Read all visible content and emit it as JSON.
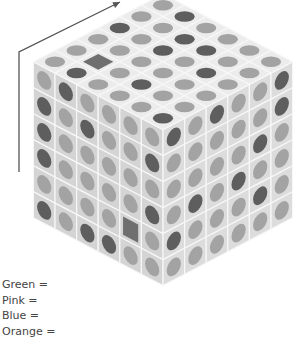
{
  "figure": {
    "type": "isometric-cube",
    "size": 6,
    "colors": {
      "face_top": "#ececec",
      "face_left": "#d4d4d4",
      "face_right": "#dcdcdc",
      "grid_line": "#f7f7f7",
      "dot_light": "#a3a3a3",
      "dot_dark": "#5e5e5e",
      "square": "#6f6f6f",
      "arrow": "#555555"
    },
    "legend_note": "cells: L = light dot, D = dark dot, S = dark square",
    "top_face": [
      [
        "L",
        "D",
        "L",
        "L",
        "L",
        "L"
      ],
      [
        "L",
        "L",
        "D",
        "D",
        "L",
        "L"
      ],
      [
        "D",
        "L",
        "D",
        "L",
        "D",
        "L"
      ],
      [
        "L",
        "L",
        "L",
        "L",
        "L",
        "L"
      ],
      [
        "L",
        "S",
        "L",
        "D",
        "L",
        "L"
      ],
      [
        "L",
        "D",
        "L",
        "L",
        "L",
        "D"
      ]
    ],
    "left_face_columns": [
      [
        "L",
        "D",
        "D",
        "D",
        "L",
        "D"
      ],
      [
        "D",
        "L",
        "L",
        "L",
        "L",
        "L"
      ],
      [
        "L",
        "D",
        "L",
        "L",
        "L",
        "D"
      ],
      [
        "L",
        "L",
        "L",
        "L",
        "L",
        "D"
      ],
      [
        "L",
        "L",
        "L",
        "L",
        "S",
        "L"
      ],
      [
        "L",
        "D",
        "L",
        "D",
        "L",
        "L"
      ]
    ],
    "right_face_columns": [
      [
        "D",
        "L",
        "L",
        "L",
        "D",
        "L"
      ],
      [
        "L",
        "L",
        "L",
        "D",
        "L",
        "L"
      ],
      [
        "D",
        "L",
        "L",
        "L",
        "L",
        "L"
      ],
      [
        "L",
        "L",
        "L",
        "D",
        "L",
        "L"
      ],
      [
        "L",
        "L",
        "D",
        "L",
        "D",
        "L"
      ],
      [
        "D",
        "D",
        "L",
        "L",
        "L",
        "L"
      ]
    ],
    "arrow": {
      "points": [
        [
          19,
          172
        ],
        [
          19,
          52
        ],
        [
          120,
          2
        ]
      ],
      "icon": "arrow-up-right-icon"
    }
  },
  "legend": {
    "items": [
      {
        "label": "Green ="
      },
      {
        "label": "Pink ="
      },
      {
        "label": "Blue ="
      },
      {
        "label": "Orange ="
      }
    ]
  }
}
